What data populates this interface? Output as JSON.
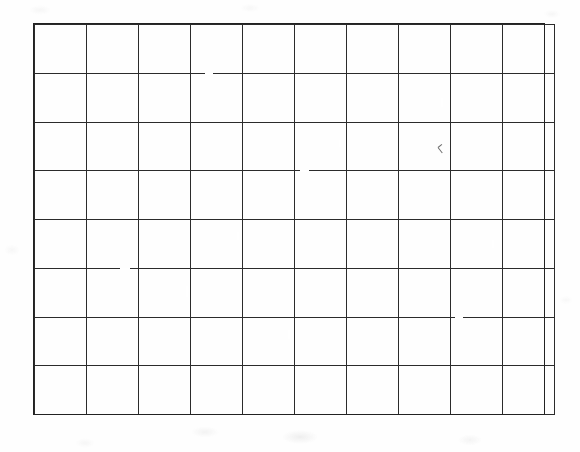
{
  "document": {
    "kind": "scanned-blank-grid",
    "description": "Blank hand-ruled grid table on white paper",
    "title": "",
    "text_content": "",
    "colors": {
      "paper": "#fefefe",
      "rule_line": "#2b2b2b",
      "frame_line": "#222222",
      "stray_mark": "#6e6e6e"
    }
  },
  "grid": {
    "columns": 10,
    "rows": 8,
    "total_cells": 80,
    "x_left": 34,
    "y_top": 24,
    "width": 510,
    "height": 390,
    "cell_width": 51,
    "cell_height": 48.75,
    "line_width_px": 1,
    "column_line_positions": [
      34,
      85,
      136,
      187,
      238,
      289,
      340,
      391,
      442,
      493,
      544
    ],
    "row_line_positions": [
      24,
      73,
      122,
      170,
      219,
      268,
      317,
      365,
      414
    ],
    "cells": [
      [
        "",
        "",
        "",
        "",
        "",
        "",
        "",
        "",
        "",
        ""
      ],
      [
        "",
        "",
        "",
        "",
        "",
        "",
        "",
        "",
        "",
        ""
      ],
      [
        "",
        "",
        "",
        "",
        "",
        "",
        "",
        "",
        "",
        ""
      ],
      [
        "",
        "",
        "",
        "",
        "",
        "",
        "",
        "",
        "",
        ""
      ],
      [
        "",
        "",
        "",
        "",
        "",
        "",
        "",
        "",
        "",
        ""
      ],
      [
        "",
        "",
        "",
        "",
        "",
        "",
        "",
        "",
        "",
        ""
      ],
      [
        "",
        "",
        "",
        "",
        "",
        "",
        "",
        "",
        "",
        ""
      ],
      [
        "",
        "",
        "",
        "",
        "",
        "",
        "",
        "",
        "",
        ""
      ]
    ]
  },
  "annotations": {
    "stray_mark": {
      "name": "pencil-tick-mark",
      "x": 438,
      "y": 143,
      "width": 7,
      "height": 14
    }
  }
}
